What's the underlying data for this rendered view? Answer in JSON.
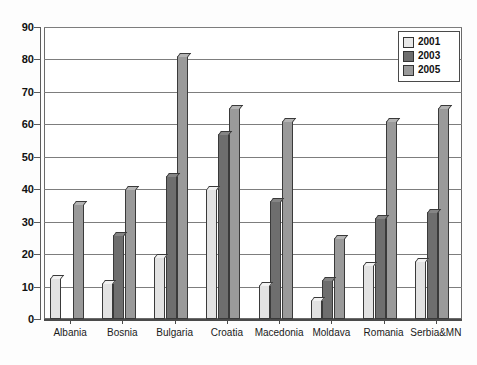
{
  "chart_data": {
    "type": "bar",
    "title": "",
    "subtitle": "",
    "xlabel": "",
    "ylabel": "",
    "ylim": [
      0,
      90
    ],
    "ytick_step": 10,
    "yticks": [
      "0",
      "10",
      "20",
      "30",
      "40",
      "50",
      "60",
      "70",
      "80",
      "90"
    ],
    "grid": true,
    "legend_position": "top-right",
    "categories": [
      "Albania",
      "Bosnia",
      "Bulgaria",
      "Croatia",
      "Macedonia",
      "Moldava",
      "Romania",
      "Serbia&MN"
    ],
    "series": [
      {
        "name": "2001",
        "color": "#e2e2e2",
        "values": [
          12.5,
          11,
          19,
          40,
          10.5,
          6,
          16.5,
          18
        ]
      },
      {
        "name": "2003",
        "color": "#6e6e6e",
        "values": [
          null,
          26,
          44,
          57,
          36.5,
          12,
          31,
          33
        ]
      },
      {
        "name": "2005",
        "color": "#9a9a9a",
        "values": [
          35.5,
          40,
          81,
          65,
          61,
          25,
          61,
          65
        ]
      }
    ]
  },
  "legend": {
    "items": [
      {
        "label": "2001"
      },
      {
        "label": "2003"
      },
      {
        "label": "2005"
      }
    ]
  },
  "colors": {
    "series_2001": "#e2e2e2",
    "series_2003": "#6e6e6e",
    "series_2005": "#9a9a9a",
    "axis": "#4a4a4a",
    "grid": "#7d7d7d",
    "background": "#ffffff"
  }
}
